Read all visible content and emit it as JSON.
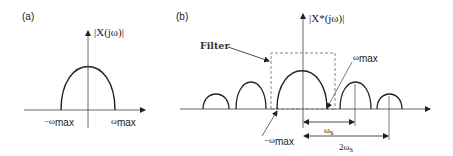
{
  "panels": {
    "a": {
      "label": "(a)",
      "y_axis_label": "|X(jω)|",
      "left_tick": "−ω",
      "left_tick_sub": "max",
      "right_tick": "ω",
      "right_tick_sub": "max"
    },
    "b": {
      "label": "(b)",
      "y_axis_label": "|X*(jω)|",
      "filter_label": "Filter",
      "neg_wmax": "−ω",
      "neg_wmax_sub": "max",
      "pos_wmax": "ω",
      "pos_wmax_sub": "max",
      "ws_label": "ω",
      "ws_sub": "s",
      "two_ws_label": "2ω",
      "two_ws_sub": "s"
    }
  },
  "colors": {
    "line": "#222222",
    "dashed": "#777777",
    "axis": "#444444"
  }
}
